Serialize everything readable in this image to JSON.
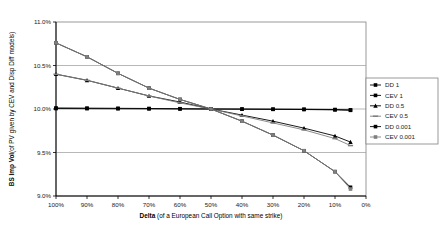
{
  "chart_data": {
    "type": "line",
    "title": "",
    "xlabel_bold": "Delta",
    "xlabel_rest": "(of a European Call Option with same strike)",
    "ylabel_bold": "BS Imp Vol",
    "ylabel_rest": "(of PV given by CEV and Disp Diff models)",
    "x": [
      100,
      90,
      80,
      70,
      60,
      50,
      40,
      30,
      20,
      10,
      5
    ],
    "xtick_labels": [
      "100%",
      "90%",
      "80%",
      "70%",
      "60%",
      "50%",
      "40%",
      "30%",
      "20%",
      "10%",
      "0%"
    ],
    "xticks": [
      100,
      90,
      80,
      70,
      60,
      50,
      40,
      30,
      20,
      10,
      0
    ],
    "ytick_labels": [
      "11.0%",
      "10.5%",
      "10.0%",
      "9.5%",
      "9.0%"
    ],
    "yticks": [
      11.0,
      10.5,
      10.0,
      9.5,
      9.0
    ],
    "xlim": [
      100,
      0
    ],
    "ylim": [
      9.0,
      11.0
    ],
    "grid": true,
    "grid_axis": "y",
    "legend_position": "right",
    "series": [
      {
        "name": "DD 1",
        "marker": "square",
        "color": "#000000",
        "values": [
          10.005,
          10.004,
          10.003,
          10.002,
          10.001,
          10.0,
          9.999,
          9.998,
          9.997,
          9.994,
          9.99
        ]
      },
      {
        "name": "CEV 1",
        "marker": "square",
        "color": "#000000",
        "values": [
          10.012,
          10.01,
          10.008,
          10.006,
          10.003,
          10.0,
          9.998,
          9.996,
          9.994,
          9.99,
          9.985
        ]
      },
      {
        "name": "DD 0.5",
        "marker": "triangle",
        "color": "#000000",
        "values": [
          10.4,
          10.33,
          10.24,
          10.15,
          10.08,
          10.0,
          9.93,
          9.86,
          9.78,
          9.69,
          9.62
        ]
      },
      {
        "name": "CEV 0.5",
        "marker": "dash",
        "color": "#7f7f7f",
        "values": [
          10.4,
          10.33,
          10.24,
          10.15,
          10.07,
          10.0,
          9.92,
          9.84,
          9.76,
          9.66,
          9.58
        ]
      },
      {
        "name": "DD 0.001",
        "marker": "square",
        "color": "#000000",
        "values": [
          10.76,
          10.6,
          10.41,
          10.24,
          10.11,
          10.0,
          9.86,
          9.7,
          9.52,
          9.28,
          9.1
        ]
      },
      {
        "name": "CEV 0.001",
        "marker": "square",
        "color": "#7f7f7f",
        "values": [
          10.76,
          10.6,
          10.41,
          10.24,
          10.11,
          10.0,
          9.86,
          9.7,
          9.52,
          9.28,
          9.08
        ]
      }
    ]
  }
}
